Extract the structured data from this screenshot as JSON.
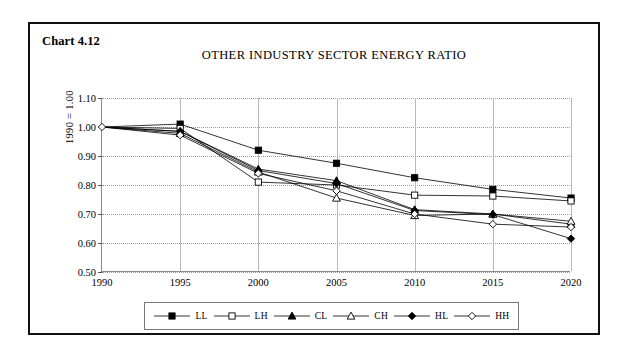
{
  "figure": {
    "chart_number": "Chart 4.12",
    "title": "OTHER INDUSTRY SECTOR ENERGY RATIO"
  },
  "axes": {
    "y_title": "1990 = 1.00",
    "y_ticks": [
      "1.10",
      "1.00",
      "0.90",
      "0.80",
      "0.70",
      "0.60",
      "0.50"
    ],
    "x_ticks": [
      "1990",
      "1995",
      "2000",
      "2005",
      "2010",
      "2015",
      "2020"
    ]
  },
  "legend": {
    "items": [
      {
        "label": "LL",
        "marker": "filled-square-marker"
      },
      {
        "label": "LH",
        "marker": "open-square-marker"
      },
      {
        "label": "CL",
        "marker": "filled-triangle-marker"
      },
      {
        "label": "CH",
        "marker": "open-triangle-marker"
      },
      {
        "label": "HL",
        "marker": "filled-diamond-marker"
      },
      {
        "label": "HH",
        "marker": "open-diamond-marker"
      }
    ]
  },
  "chart_data": {
    "type": "line",
    "title": "OTHER INDUSTRY SECTOR ENERGY RATIO",
    "xlabel": "",
    "ylabel": "1990 = 1.00",
    "x": [
      1990,
      1995,
      2000,
      2005,
      2010,
      2015,
      2020
    ],
    "xlim": [
      1990,
      2020
    ],
    "ylim": [
      0.5,
      1.1
    ],
    "ytick_step": 0.1,
    "grid": "horizontal-dotted-and-vertical-solid",
    "legend_position": "bottom",
    "colors": {
      "line": "#000000",
      "grid": "#9a9a9a",
      "frame": "#111111"
    },
    "series": [
      {
        "name": "LL",
        "marker": "filled-square",
        "values": [
          1.0,
          1.01,
          0.92,
          0.875,
          0.825,
          0.785,
          0.755
        ]
      },
      {
        "name": "LH",
        "marker": "open-square",
        "values": [
          1.0,
          0.995,
          0.81,
          0.8,
          0.765,
          0.762,
          0.745
        ]
      },
      {
        "name": "CL",
        "marker": "filled-triangle",
        "values": [
          1.0,
          0.985,
          0.855,
          0.815,
          0.715,
          0.7,
          0.665
        ]
      },
      {
        "name": "CH",
        "marker": "open-triangle",
        "values": [
          1.0,
          0.978,
          0.845,
          0.755,
          0.695,
          0.7,
          0.675
        ]
      },
      {
        "name": "HL",
        "marker": "filled-diamond",
        "values": [
          1.0,
          0.985,
          0.85,
          0.805,
          0.712,
          0.698,
          0.615
        ]
      },
      {
        "name": "HH",
        "marker": "open-diamond",
        "values": [
          1.0,
          0.972,
          0.84,
          0.78,
          0.7,
          0.665,
          0.655
        ]
      }
    ]
  }
}
